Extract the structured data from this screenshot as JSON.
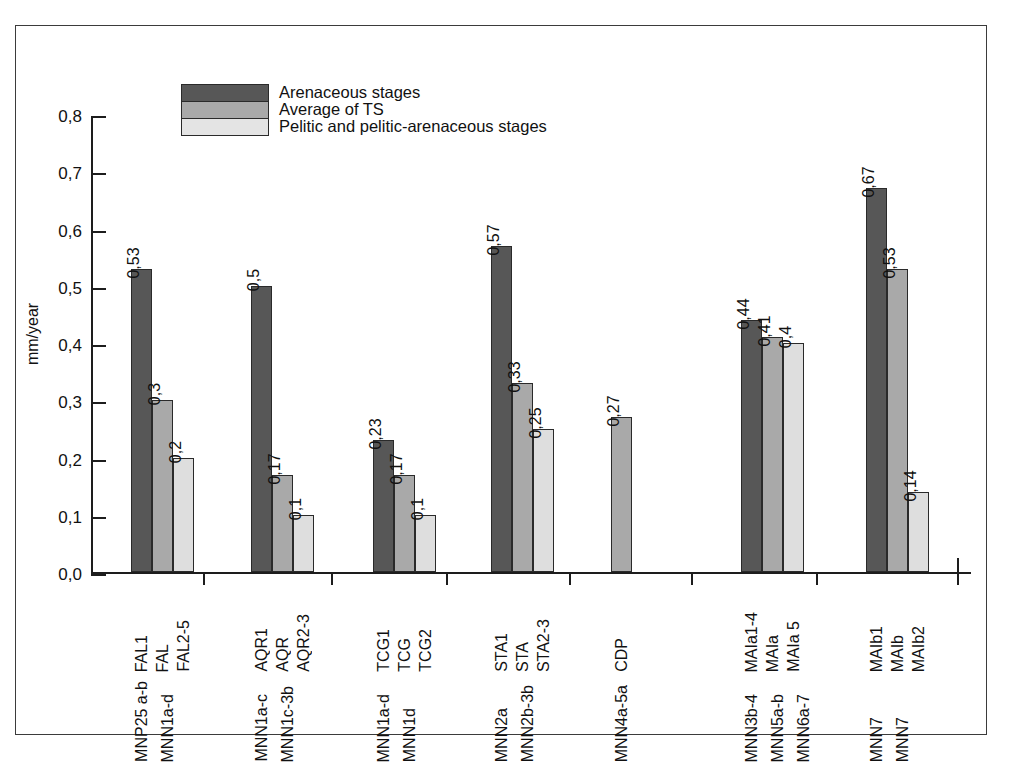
{
  "chart_data": {
    "type": "bar",
    "title": "",
    "xlabel": "",
    "ylabel": "mm/year",
    "ylim": [
      0,
      0.8
    ],
    "yticks": [
      0,
      0.1,
      0.2,
      0.3,
      0.4,
      0.5,
      0.6,
      0.7,
      0.8
    ],
    "ytick_labels": [
      "0,0",
      "0,1",
      "0,2",
      "0,3",
      "0,4",
      "0,5",
      "0,6",
      "0,7",
      "0,8"
    ],
    "grid": false,
    "legend_position": "top-left",
    "series": [
      {
        "name": "Arenaceous stages",
        "color": "#575757",
        "values": [
          0.53,
          0.5,
          0.23,
          0.57,
          null,
          0.44,
          0.67
        ]
      },
      {
        "name": "Average of TS",
        "color": "#a9a9a9",
        "values": [
          0.3,
          0.17,
          0.17,
          0.33,
          0.27,
          0.41,
          0.53
        ]
      },
      {
        "name": "Pelitic and pelitic-arenaceous stages",
        "color": "#dedede",
        "values": [
          0.2,
          0.1,
          0.1,
          0.25,
          null,
          0.4,
          0.14
        ]
      }
    ],
    "groups": [
      {
        "id": "group-fal",
        "bar_labels": [
          "FAL1",
          "FAL",
          "FAL2-5"
        ],
        "value_labels": [
          "0,53",
          "0,3",
          "0,2"
        ],
        "values": [
          0.53,
          0.3,
          0.2
        ],
        "series_index": [
          0,
          1,
          2
        ],
        "secondary_labels": [
          "MNP25 a-b",
          "MNN1a-d"
        ]
      },
      {
        "id": "group-aqr",
        "bar_labels": [
          "AQR1",
          "AQR",
          "AQR2-3"
        ],
        "value_labels": [
          "0,5",
          "0,17",
          "0,1"
        ],
        "values": [
          0.5,
          0.17,
          0.1
        ],
        "series_index": [
          0,
          1,
          2
        ],
        "secondary_labels": [
          "MNN1a-c",
          "MNN1c-3b"
        ]
      },
      {
        "id": "group-tcg",
        "bar_labels": [
          "TCG1",
          "TCG",
          "TCG2"
        ],
        "value_labels": [
          "0,23",
          "0,17",
          "0,1"
        ],
        "values": [
          0.23,
          0.17,
          0.1
        ],
        "series_index": [
          0,
          1,
          2
        ],
        "secondary_labels": [
          "MNN1a-d",
          "MNN1d"
        ]
      },
      {
        "id": "group-sta",
        "bar_labels": [
          "STA1",
          "STA",
          "STA2-3"
        ],
        "value_labels": [
          "0,57",
          "0,33",
          "0,25"
        ],
        "values": [
          0.57,
          0.33,
          0.25
        ],
        "series_index": [
          0,
          1,
          2
        ],
        "secondary_labels": [
          "MNN2a",
          "MNN2b-3b"
        ]
      },
      {
        "id": "group-cdp",
        "bar_labels": [
          "CDP"
        ],
        "value_labels": [
          "0,27"
        ],
        "values": [
          0.27
        ],
        "series_index": [
          1
        ],
        "secondary_labels": [
          "MNN4a-5a"
        ]
      },
      {
        "id": "group-maia",
        "bar_labels": [
          "MAIa1-4",
          "MAIa",
          "MAIa 5"
        ],
        "value_labels": [
          "0,44",
          "0,41",
          "0,4"
        ],
        "values": [
          0.44,
          0.41,
          0.4
        ],
        "series_index": [
          0,
          1,
          2
        ],
        "secondary_labels": [
          "MNN3b-4",
          "MNN5a-b",
          "MNN6a-7"
        ]
      },
      {
        "id": "group-maib",
        "bar_labels": [
          "MAIb1",
          "MAIb",
          "MAIb2"
        ],
        "value_labels": [
          "0,67",
          "0,53",
          "0,14"
        ],
        "values": [
          0.67,
          0.53,
          0.14
        ],
        "series_index": [
          0,
          1,
          2
        ],
        "secondary_labels": [
          "MNN7",
          "MNN7"
        ]
      }
    ]
  },
  "legend": {
    "items": [
      {
        "label": "Arenaceous stages",
        "color": "#575757"
      },
      {
        "label": "Average of TS",
        "color": "#a9a9a9"
      },
      {
        "label": "Pelitic and pelitic-arenaceous stages",
        "color": "#e4e4e4"
      }
    ]
  },
  "axis": {
    "y_title": "mm/year",
    "y_tick_labels": [
      "0,8",
      "0,7",
      "0,6",
      "0,5",
      "0,4",
      "0,3",
      "0,2",
      "0,1",
      "0,0"
    ]
  }
}
